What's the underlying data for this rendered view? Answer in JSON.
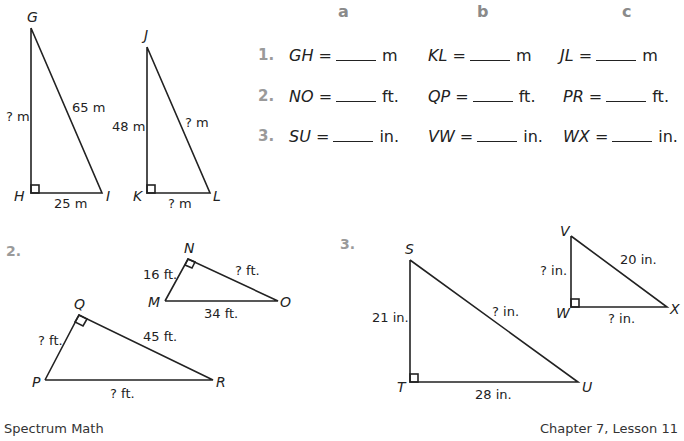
{
  "columns": [
    "a",
    "b",
    "c"
  ],
  "questions": [
    {
      "number": "1.",
      "items": [
        {
          "var": "GH",
          "eq": "=",
          "unit": "m"
        },
        {
          "var": "KL",
          "eq": "=",
          "unit": "m"
        },
        {
          "var": "JL",
          "eq": "=",
          "unit": "m"
        }
      ]
    },
    {
      "number": "2.",
      "items": [
        {
          "var": "NO",
          "eq": "=",
          "unit": "ft."
        },
        {
          "var": "QP",
          "eq": "=",
          "unit": "ft."
        },
        {
          "var": "PR",
          "eq": "=",
          "unit": "ft."
        }
      ]
    },
    {
      "number": "3.",
      "items": [
        {
          "var": "SU",
          "eq": "=",
          "unit": "in."
        },
        {
          "var": "VW",
          "eq": "=",
          "unit": "in."
        },
        {
          "var": "WX",
          "eq": "=",
          "unit": "in."
        }
      ]
    }
  ],
  "figures": {
    "section2_label": "2.",
    "section3_label": "3.",
    "tri_GHI": {
      "G": "G",
      "H": "H",
      "I": "I",
      "side_GH": "? m",
      "side_GI": "65 m",
      "side_HI": "25 m"
    },
    "tri_JKL": {
      "J": "J",
      "K": "K",
      "L": "L",
      "side_JK": "48 m",
      "side_JL": "? m",
      "side_KL": "? m"
    },
    "tri_MNO": {
      "M": "M",
      "N": "N",
      "O": "O",
      "side_MN": "16 ft.",
      "side_NO": "? ft.",
      "side_MO": "34 ft."
    },
    "tri_PQR": {
      "P": "P",
      "Q": "Q",
      "R": "R",
      "side_PQ": "? ft.",
      "side_QR": "45 ft.",
      "side_PR": "? ft."
    },
    "tri_STU": {
      "S": "S",
      "T": "T",
      "U": "U",
      "side_ST": "21 in.",
      "side_SU": "? in.",
      "side_TU": "28 in."
    },
    "tri_VWX": {
      "V": "V",
      "W": "W",
      "X": "X",
      "side_VW": "? in.",
      "side_VX": "20 in.",
      "side_WX": "? in."
    }
  },
  "footer": {
    "left": "Spectrum Math",
    "right": "Chapter 7, Lesson 11",
    "left_cut": "Grade 8",
    "right_cut": "..."
  }
}
